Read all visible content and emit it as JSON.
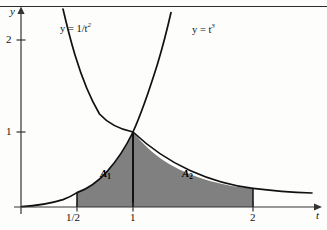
{
  "figure": {
    "background_color": "#fdfdfc",
    "ink_color": "#111111",
    "shade_color": "#808080",
    "shade_edge_color": "#111111",
    "top_rule": true
  },
  "axes": {
    "y_axis_label": "y",
    "x_axis_label": "t",
    "origin_px": {
      "x": 21,
      "y": 207
    },
    "x_unit_px": 112,
    "y_unit_px": 75,
    "y_ticks": [
      {
        "value": 1,
        "label": "1"
      },
      {
        "value": 2,
        "label": "2"
      }
    ],
    "x_ticks": [
      {
        "value": 0.5,
        "label": "1/2"
      },
      {
        "value": 1,
        "label": "1"
      },
      {
        "value": 2,
        "label": "2"
      }
    ]
  },
  "curves": [
    {
      "name": "reciprocal-square-curve",
      "label_html": "y = 1/t<sup>2</sup>",
      "label_plain": "y = 1/t^2",
      "expression": "y = 1/t^2",
      "label_pos_px": {
        "x": 60,
        "y": 22
      }
    },
    {
      "name": "cubic-curve",
      "label_html": "y = t<sup>3</sup>",
      "label_plain": "y = t^3",
      "expression": "y = t^3",
      "label_pos_px": {
        "x": 192,
        "y": 23
      }
    }
  ],
  "regions": [
    {
      "name": "area-one",
      "label_html": "A<sub>1</sub>",
      "label_plain": "A_1",
      "t_from": 0.5,
      "t_to": 1,
      "bounded_above_by": "y = t^3",
      "label_pos_px": {
        "x": 100,
        "y": 173
      }
    },
    {
      "name": "area-two",
      "label_html": "A<sub>2</sub>",
      "label_plain": "A_2",
      "t_from": 1,
      "t_to": 2,
      "bounded_above_by": "y = 1/t^2",
      "label_pos_px": {
        "x": 182,
        "y": 173
      }
    }
  ],
  "chart_data": {
    "type": "line",
    "title": "",
    "xlabel": "t",
    "ylabel": "y",
    "xlim": [
      0,
      2.72
    ],
    "ylim": [
      0,
      2.75
    ],
    "grid": false,
    "legend": "inline-curve-labels",
    "series": [
      {
        "name": "y = 1/t^2",
        "x": [
          0.38,
          0.45,
          0.5,
          0.6,
          0.7,
          0.8,
          0.9,
          1.0,
          1.2,
          1.4,
          1.6,
          1.8,
          2.0,
          2.2,
          2.4,
          2.6,
          2.7
        ],
        "y": [
          6.93,
          4.94,
          4.0,
          2.78,
          2.04,
          1.56,
          1.23,
          1.0,
          0.69,
          0.51,
          0.39,
          0.31,
          0.25,
          0.21,
          0.17,
          0.15,
          0.14
        ]
      },
      {
        "name": "y = t^3",
        "x": [
          0.0,
          0.2,
          0.4,
          0.5,
          0.6,
          0.7,
          0.8,
          0.9,
          1.0,
          1.1,
          1.2,
          1.3,
          1.38
        ],
        "y": [
          0.0,
          0.008,
          0.064,
          0.125,
          0.216,
          0.343,
          0.512,
          0.729,
          1.0,
          1.331,
          1.728,
          2.197,
          2.63
        ]
      }
    ],
    "intersection": {
      "x": 1,
      "y": 1
    },
    "shaded_regions": [
      {
        "label": "A_1",
        "x_from": 0.5,
        "x_to": 1.0,
        "upper": "y = t^3",
        "lower": "y = 0"
      },
      {
        "label": "A_2",
        "x_from": 1.0,
        "x_to": 2.0,
        "upper": "y = 1/t^2",
        "lower": "y = 0"
      }
    ]
  }
}
